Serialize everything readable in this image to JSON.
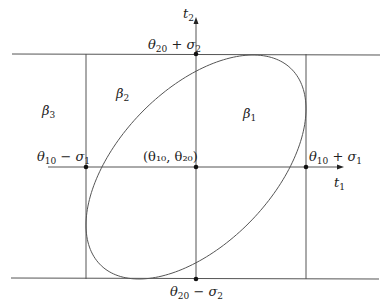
{
  "diagram": {
    "type": "confidence-region-ellipse",
    "axes": {
      "x_label": {
        "base": "t",
        "sub": "1"
      },
      "y_label": {
        "base": "t",
        "sub": "2"
      }
    },
    "center_label": "(θ₁₀, θ₂₀)",
    "bounds": {
      "top": {
        "text": "θ",
        "sub": "20",
        "rest": " + σ",
        "sub2": "2"
      },
      "bottom": {
        "text": "θ",
        "sub": "20",
        "rest": " − σ",
        "sub2": "2"
      },
      "left": {
        "text": "θ",
        "sub": "10",
        "rest": " − σ",
        "sub2": "1"
      },
      "right": {
        "text": "θ",
        "sub": "10",
        "rest": " + σ",
        "sub2": "1"
      }
    },
    "regions": [
      {
        "base": "β",
        "sub": "1"
      },
      {
        "base": "β",
        "sub": "2"
      },
      {
        "base": "β",
        "sub": "3"
      }
    ],
    "geometry": {
      "center": [
        196,
        167
      ],
      "half_width": 110,
      "half_height": 112,
      "phase": 0.545,
      "top_y": 54,
      "bottom_y": 279,
      "left_x": 86,
      "right_x": 306,
      "h_line_x": [
        12,
        380
      ],
      "x_axis": [
        48,
        344
      ],
      "y_axis_top": 17
    },
    "colors": {
      "line": "#555555",
      "dot": "#111111"
    }
  }
}
